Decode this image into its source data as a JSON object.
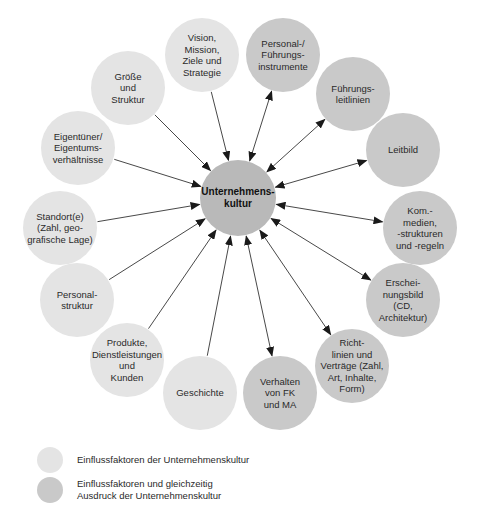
{
  "diagram": {
    "center": {
      "label": "Unternehmens-\nkultur",
      "x": 238,
      "y": 198,
      "r": 38
    },
    "nodes": [
      {
        "id": "vision",
        "label": "Vision,\nMission,\nZiele und\nStrategie",
        "x": 202,
        "y": 55,
        "r": 37,
        "type": "light",
        "arrow": "in"
      },
      {
        "id": "personal-fuehrungsinstrumente",
        "label": "Personal-/\nFührungs-\ninstrumente",
        "x": 283,
        "y": 55,
        "r": 37,
        "type": "dark",
        "arrow": "both"
      },
      {
        "id": "fuehrungsleitlinien",
        "label": "Führungs-\nleitlinien",
        "x": 353,
        "y": 94,
        "r": 37,
        "type": "dark",
        "arrow": "both"
      },
      {
        "id": "leitbild",
        "label": "Leitbild",
        "x": 403,
        "y": 150,
        "r": 37,
        "type": "dark",
        "arrow": "both"
      },
      {
        "id": "kommunikation",
        "label": "Kom.-\nmedien,\n-strukturen\nund -regeln",
        "x": 420,
        "y": 228,
        "r": 37,
        "type": "dark",
        "arrow": "both"
      },
      {
        "id": "erscheinungsbild",
        "label": "Erschei-\nnungsbild\n(CD,\nArchitektur)",
        "x": 403,
        "y": 300,
        "r": 37,
        "type": "dark",
        "arrow": "both"
      },
      {
        "id": "richtlinien",
        "label": "Richt-\nlinien und\nVerträge (Zahl,\nArt, Inhalte,\nForm)",
        "x": 352,
        "y": 366,
        "r": 37,
        "type": "dark",
        "arrow": "both"
      },
      {
        "id": "verhalten",
        "label": "Verhalten\nvon FK\nund MA",
        "x": 280,
        "y": 393,
        "r": 37,
        "type": "dark",
        "arrow": "both"
      },
      {
        "id": "geschichte",
        "label": "Geschichte",
        "x": 200,
        "y": 393,
        "r": 37,
        "type": "light",
        "arrow": "in"
      },
      {
        "id": "produkte",
        "label": "Produkte,\nDienstleistungen\nund\nKunden",
        "x": 127,
        "y": 360,
        "r": 37,
        "type": "light",
        "arrow": "in"
      },
      {
        "id": "personalstruktur",
        "label": "Personal-\nstruktur",
        "x": 77,
        "y": 300,
        "r": 37,
        "type": "light",
        "arrow": "in"
      },
      {
        "id": "standort",
        "label": "Standort(e)\n(Zahl, geo-\ngrafische Lage)",
        "x": 60,
        "y": 228,
        "r": 37,
        "type": "light",
        "arrow": "in"
      },
      {
        "id": "eigentuemer",
        "label": "Eigentüner/\nEigentums-\nverhältnisse",
        "x": 78,
        "y": 148,
        "r": 37,
        "type": "light",
        "arrow": "in"
      },
      {
        "id": "groesse",
        "label": "Größe\nund\nStruktur",
        "x": 128,
        "y": 88,
        "r": 37,
        "type": "light",
        "arrow": "in"
      }
    ]
  },
  "legend": {
    "items": [
      {
        "type": "light",
        "label": "Einflussfaktoren der Unternehmenskultur"
      },
      {
        "type": "dark",
        "label": "Einflussfaktoren und gleichzeitig\nAusdruck der Unternehmenskultur"
      }
    ]
  },
  "colors": {
    "light_node": "#e4e4e4",
    "dark_node": "#c9c9c9",
    "center_node": "#b9b9b9",
    "arrow": "#333333"
  }
}
